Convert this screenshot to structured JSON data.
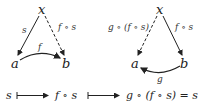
{
  "diagram_left": {
    "nodes": {
      "x": "x",
      "a": "a",
      "b": "b"
    },
    "edges": {
      "x_to_a": {
        "label": "s",
        "style": "solid"
      },
      "x_to_b": {
        "label": "f ∘ s",
        "style": "dashed"
      },
      "a_to_b": {
        "label": "f",
        "style": "solid-curved"
      }
    }
  },
  "diagram_right": {
    "nodes": {
      "x": "x",
      "a": "a",
      "b": "b"
    },
    "edges": {
      "x_to_a": {
        "label": "g ∘ (f ∘ s)",
        "style": "dashed"
      },
      "x_to_b": {
        "label": "f ∘ s",
        "style": "solid"
      },
      "b_to_a": {
        "label": "g",
        "style": "solid-curved"
      }
    }
  },
  "mapping_row": {
    "term1": "s",
    "term2": "f ∘ s",
    "term3": "g ∘ (f ∘ s) = s"
  }
}
